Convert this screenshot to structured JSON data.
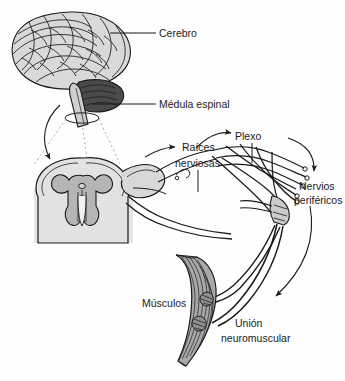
{
  "figure": {
    "background_color": "#fefefe",
    "line_color": "#1a1a1a",
    "label_color": "#1a1a1a"
  },
  "labels": {
    "cerebro": "Cerebro",
    "medula_espinal": "Médula espinal",
    "raices_line1": "Raíces",
    "raices_line2": "nerviosas",
    "plexo": "Plexo",
    "nervios_line1": "Nervios",
    "nervios_line2": "periféricos",
    "musculos": "Músculos",
    "union_line1": "Unión",
    "union_line2": "neuromuscular"
  },
  "structures": {
    "brain": {
      "name": "Cerebro",
      "fill": "#d9d9d9",
      "stroke": "#1a1a1a"
    },
    "cerebellum": {
      "name": "Cerebelo",
      "fill": "#4a4a4a",
      "stroke": "#1a1a1a"
    },
    "brainstem": {
      "name": "Tronco encefálico",
      "fill": "#cfcfcf",
      "stroke": "#1a1a1a"
    },
    "spinal_cord": {
      "name": "Médula espinal (corte transversal)",
      "white_matter_fill": "#e2e2e2",
      "gray_matter_fill": "#b5b5b5",
      "stroke": "#1a1a1a"
    },
    "nerve_roots": {
      "name": "Raíces nerviosas",
      "fill": "#d8d8d8",
      "stroke": "#1a1a1a"
    },
    "plexus": {
      "name": "Plexo braquial",
      "fill": "#d4d4d4",
      "stroke": "#1a1a1a"
    },
    "peripheral_nerves": {
      "name": "Nervios periféricos",
      "fill": "#cccccc",
      "stroke": "#1a1a1a"
    },
    "muscle": {
      "name": "Músculo fusiforme",
      "fill": "#a8a8a8",
      "stroke": "#1a1a1a"
    },
    "nmj": {
      "name": "Unión neuromuscular",
      "fill": "#8f8f8f",
      "stroke": "#1a1a1a"
    }
  }
}
